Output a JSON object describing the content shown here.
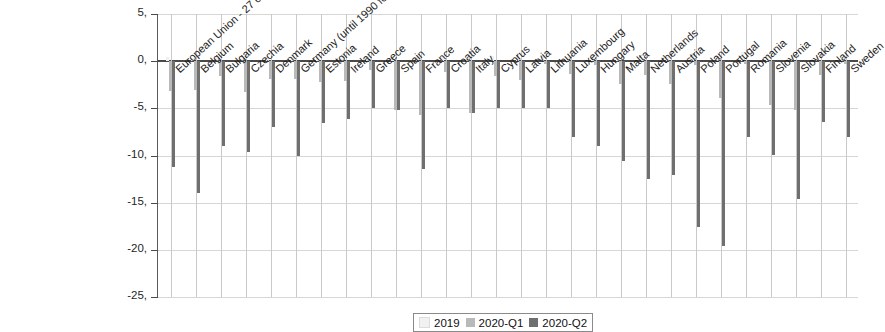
{
  "chart_data": {
    "type": "bar",
    "title": "",
    "subtitle": "",
    "xlabel": "",
    "ylabel": "",
    "ylim": [
      -25,
      5
    ],
    "yticks": [
      "5,",
      "0,",
      "-5,",
      "-10,",
      "-15,",
      "-20,",
      "-25,"
    ],
    "ytick_values": [
      5,
      0,
      -5,
      -10,
      -15,
      -20,
      -25
    ],
    "grid": true,
    "legend_position": "bottom-center",
    "categories": [
      "European Union - 27 countries (from 2020)",
      "Belgium",
      "Bulgaria",
      "Czechia",
      "Denmark",
      "Germany (until 1990 former territory of the FRG)",
      "Estonia",
      "Ireland",
      "Greece",
      "Spain",
      "France",
      "Croatia",
      "Italy",
      "Cyprus",
      "Latvia",
      "Lithuania",
      "Luxembourg",
      "Hungary",
      "Malta",
      "Netherlands",
      "Austria",
      "Poland",
      "Portugal",
      "Romania",
      "Slovenia",
      "Slovakia",
      "Finland",
      "Sweden"
    ],
    "series": [
      {
        "name": "2019",
        "color": "#f1f1f1",
        "values": [
          0.4,
          0.3,
          0.6,
          0.5,
          0.4,
          0.3,
          0.7,
          0.8,
          0.6,
          0.5,
          0.4,
          0.6,
          0.3,
          0.5,
          0.7,
          0.6,
          0.4,
          0.8,
          0.5,
          0.4,
          0.5,
          0.9,
          0.6,
          1.0,
          0.7,
          0.6,
          0.5,
          0.4
        ]
      },
      {
        "name": "2020-Q1",
        "color": "#b9b9b9",
        "values": [
          -3.2,
          -3.1,
          -1.6,
          -3.3,
          -1.9,
          -1.9,
          -2.2,
          -2.1,
          -0.9,
          -5.2,
          -5.7,
          -1.2,
          -5.5,
          -1.6,
          -2.0,
          -0.3,
          -1.4,
          -0.4,
          -2.4,
          -1.5,
          -2.4,
          -0.4,
          -3.9,
          -0.3,
          -4.7,
          -5.2,
          -1.5,
          -0.3
        ]
      },
      {
        "name": "2020-Q2",
        "color": "#6f6f6f",
        "values": [
          -11.2,
          -14.0,
          -9.0,
          -9.6,
          -7.0,
          -10.1,
          -6.6,
          -6.1,
          -5.0,
          -5.2,
          -11.4,
          -5.0,
          -5.5,
          -5.0,
          -5.0,
          -5.0,
          -8.0,
          -9.0,
          -10.6,
          -12.5,
          -12.1,
          -17.6,
          -19.6,
          -8.0,
          -10.0,
          -14.6,
          -6.5,
          -8.0
        ]
      }
    ]
  },
  "legend": {
    "items": [
      {
        "label": "2019",
        "color": "#f1f1f1"
      },
      {
        "label": "2020-Q1",
        "color": "#b9b9b9"
      },
      {
        "label": "2020-Q2",
        "color": "#6f6f6f"
      }
    ]
  }
}
